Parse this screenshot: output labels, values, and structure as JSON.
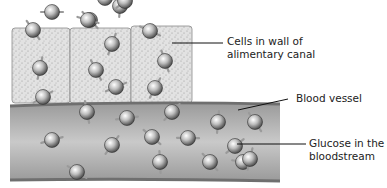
{
  "diagram": {
    "labels": {
      "cells": [
        "Cells in wall of",
        "alimentary canal"
      ],
      "blood_vessel": "Blood vessel",
      "glucose": [
        "Glucose in the",
        "bloodstream"
      ]
    },
    "colors": {
      "cell_fill": "#d9d9d9",
      "vessel_fill": "#a9a9a9",
      "vessel_wall": "#6f6f6f",
      "molecule": "#8a8a8a",
      "leader_line": "#111111"
    },
    "cells_count": 3,
    "molecules": {
      "above_cells": [
        [
          52,
          12
        ],
        [
          90,
          20
        ],
        [
          120,
          6
        ],
        [
          125,
          1
        ],
        [
          105,
          -2
        ]
      ],
      "in_cells": [
        [
          33,
          30
        ],
        [
          40,
          68
        ],
        [
          43,
          97
        ],
        [
          88,
          20
        ],
        [
          96,
          70
        ],
        [
          112,
          44
        ],
        [
          116,
          87
        ],
        [
          150,
          31
        ],
        [
          165,
          61
        ],
        [
          155,
          88
        ]
      ],
      "in_vessel": [
        [
          52,
          140
        ],
        [
          77,
          172
        ],
        [
          87,
          112
        ],
        [
          112,
          145
        ],
        [
          127,
          118
        ],
        [
          152,
          137
        ],
        [
          160,
          162
        ],
        [
          172,
          112
        ],
        [
          188,
          138
        ],
        [
          210,
          162
        ],
        [
          218,
          122
        ],
        [
          235,
          146
        ],
        [
          243,
          162
        ],
        [
          255,
          122
        ],
        [
          250,
          159
        ]
      ]
    }
  }
}
